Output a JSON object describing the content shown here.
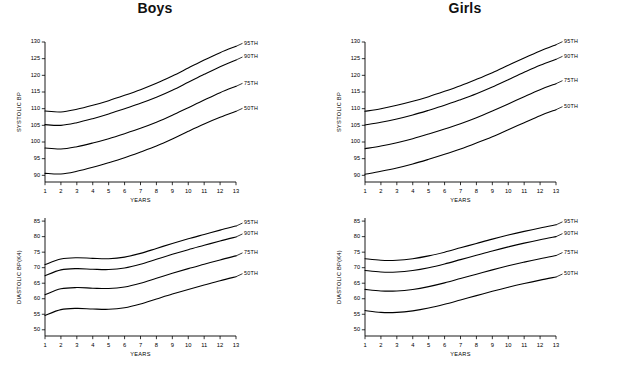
{
  "figure": {
    "background": "#ffffff",
    "line_color": "#000000",
    "width": 620,
    "height": 368
  },
  "panels": [
    {
      "id": "boys-systolic",
      "title": "Boys",
      "show_title": true,
      "measure": "systolic",
      "sex": "Boys"
    },
    {
      "id": "girls-systolic",
      "title": "Girls",
      "show_title": true,
      "measure": "systolic",
      "sex": "Girls"
    },
    {
      "id": "boys-diastolic",
      "title": "",
      "show_title": false,
      "measure": "diastolic",
      "sex": "Boys"
    },
    {
      "id": "girls-diastolic",
      "title": "",
      "show_title": false,
      "measure": "diastolic",
      "sex": "Girls"
    }
  ],
  "chart_data": [
    {
      "id": "boys-systolic",
      "type": "line",
      "title": "Boys",
      "xlabel": "YEARS",
      "ylabel": "SYSTOLIC BP",
      "xlim": [
        1,
        13
      ],
      "ylim": [
        88,
        130
      ],
      "xticks": [
        1,
        2,
        3,
        4,
        5,
        6,
        7,
        8,
        9,
        10,
        11,
        12,
        13
      ],
      "yticks": [
        90,
        95,
        100,
        105,
        110,
        115,
        120,
        125,
        130
      ],
      "grid": false,
      "legend": "right-end-labels",
      "x": [
        1,
        2,
        3,
        4,
        5,
        6,
        7,
        8,
        9,
        10,
        11,
        12,
        13
      ],
      "series": [
        {
          "name": "95TH",
          "values": [
            109.3,
            109.0,
            109.8,
            111.0,
            112.4,
            114.0,
            115.7,
            117.6,
            119.8,
            122.2,
            124.6,
            126.8,
            128.7
          ]
        },
        {
          "name": "90TH",
          "values": [
            105.2,
            105.0,
            105.8,
            107.0,
            108.4,
            110.0,
            111.6,
            113.4,
            115.5,
            117.9,
            120.3,
            122.6,
            124.6
          ]
        },
        {
          "name": "75TH",
          "values": [
            98.2,
            97.9,
            98.6,
            99.7,
            101.0,
            102.5,
            104.1,
            105.9,
            108.0,
            110.3,
            112.6,
            114.8,
            116.7
          ]
        },
        {
          "name": "50TH",
          "values": [
            90.6,
            90.4,
            91.2,
            92.4,
            93.8,
            95.3,
            97.0,
            98.8,
            100.9,
            103.2,
            105.4,
            107.4,
            109.2
          ]
        }
      ]
    },
    {
      "id": "girls-systolic",
      "type": "line",
      "title": "Girls",
      "xlabel": "YEARS",
      "ylabel": "SYSTOLIC BP",
      "xlim": [
        1,
        13
      ],
      "ylim": [
        88,
        130
      ],
      "xticks": [
        1,
        2,
        3,
        4,
        5,
        6,
        7,
        8,
        9,
        10,
        11,
        12,
        13
      ],
      "yticks": [
        90,
        95,
        100,
        105,
        110,
        115,
        120,
        125,
        130
      ],
      "grid": false,
      "legend": "right-end-labels",
      "x": [
        1,
        2,
        3,
        4,
        5,
        6,
        7,
        8,
        9,
        10,
        11,
        12,
        13
      ],
      "series": [
        {
          "name": "95TH",
          "values": [
            109.2,
            110.0,
            111.0,
            112.2,
            113.6,
            115.2,
            116.9,
            118.8,
            120.8,
            123.0,
            125.2,
            127.3,
            129.2
          ]
        },
        {
          "name": "90TH",
          "values": [
            105.1,
            105.9,
            106.9,
            108.1,
            109.5,
            111.0,
            112.7,
            114.5,
            116.5,
            118.7,
            120.9,
            123.0,
            124.8
          ]
        },
        {
          "name": "75TH",
          "values": [
            98.0,
            98.8,
            99.8,
            101.0,
            102.4,
            103.9,
            105.5,
            107.3,
            109.3,
            111.4,
            113.6,
            115.7,
            117.5
          ]
        },
        {
          "name": "50TH",
          "values": [
            90.3,
            91.2,
            92.2,
            93.4,
            94.8,
            96.3,
            97.9,
            99.7,
            101.6,
            103.7,
            105.8,
            107.9,
            109.7
          ]
        }
      ]
    },
    {
      "id": "boys-diastolic",
      "type": "line",
      "title": "Boys",
      "xlabel": "YEARS",
      "ylabel": "DIASTOLIC BP(K4)",
      "xlim": [
        1,
        13
      ],
      "ylim": [
        48,
        86
      ],
      "xticks": [
        1,
        2,
        3,
        4,
        5,
        6,
        7,
        8,
        9,
        10,
        11,
        12,
        13
      ],
      "yticks": [
        50,
        55,
        60,
        65,
        70,
        75,
        80,
        85
      ],
      "grid": false,
      "legend": "right-end-labels",
      "x": [
        1,
        2,
        3,
        4,
        5,
        6,
        7,
        8,
        9,
        10,
        11,
        12,
        13
      ],
      "series": [
        {
          "name": "95TH",
          "values": [
            71.0,
            72.8,
            73.2,
            73.0,
            72.9,
            73.4,
            74.6,
            76.2,
            77.8,
            79.3,
            80.7,
            82.1,
            83.4
          ]
        },
        {
          "name": "90TH",
          "values": [
            67.4,
            69.3,
            69.7,
            69.5,
            69.4,
            69.9,
            71.1,
            72.7,
            74.3,
            75.8,
            77.2,
            78.6,
            79.9
          ]
        },
        {
          "name": "75TH",
          "values": [
            61.3,
            63.2,
            63.6,
            63.4,
            63.3,
            63.8,
            65.0,
            66.6,
            68.2,
            69.7,
            71.1,
            72.5,
            73.8
          ]
        },
        {
          "name": "50TH",
          "values": [
            54.6,
            56.5,
            56.9,
            56.7,
            56.6,
            57.1,
            58.3,
            59.9,
            61.5,
            63.0,
            64.4,
            65.8,
            67.1
          ]
        }
      ]
    },
    {
      "id": "girls-diastolic",
      "type": "line",
      "title": "Girls",
      "xlabel": "YEARS",
      "ylabel": "DIASTOLIC BP(K4)",
      "xlim": [
        1,
        13
      ],
      "ylim": [
        48,
        86
      ],
      "xticks": [
        1,
        2,
        3,
        4,
        5,
        6,
        7,
        8,
        9,
        10,
        11,
        12,
        13
      ],
      "yticks": [
        50,
        55,
        60,
        65,
        70,
        75,
        80,
        85
      ],
      "grid": false,
      "legend": "right-end-labels",
      "x": [
        1,
        2,
        3,
        4,
        5,
        6,
        7,
        8,
        9,
        10,
        11,
        12,
        13
      ],
      "series": [
        {
          "name": "95TH",
          "values": [
            72.9,
            72.4,
            72.4,
            72.9,
            73.8,
            75.0,
            76.4,
            77.8,
            79.2,
            80.5,
            81.7,
            82.8,
            83.8
          ]
        },
        {
          "name": "90TH",
          "values": [
            69.1,
            68.6,
            68.6,
            69.1,
            70.0,
            71.2,
            72.6,
            74.0,
            75.4,
            76.7,
            77.9,
            79.0,
            80.0
          ]
        },
        {
          "name": "75TH",
          "values": [
            63.0,
            62.5,
            62.5,
            63.0,
            63.9,
            65.1,
            66.5,
            67.9,
            69.3,
            70.6,
            71.8,
            72.9,
            73.9
          ]
        },
        {
          "name": "50TH",
          "values": [
            56.2,
            55.6,
            55.6,
            56.1,
            57.0,
            58.2,
            59.6,
            61.0,
            62.4,
            63.7,
            64.9,
            66.0,
            67.0
          ]
        }
      ]
    }
  ]
}
